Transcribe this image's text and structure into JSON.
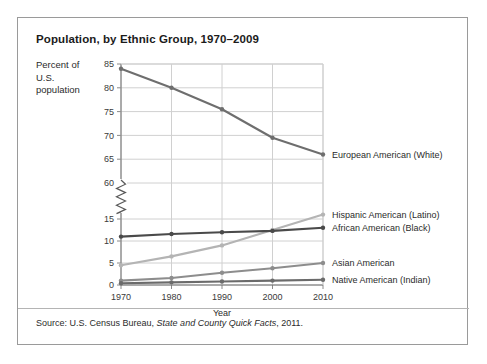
{
  "title": "Population, by Ethnic Group, 1970–2009",
  "axis_title": "Percent of U.S. population",
  "source": {
    "prefix": "Source:",
    "publisher": "U.S. Census Bureau,",
    "work": "State and County Quick Facts",
    "year": ", 2011."
  },
  "chart_data": {
    "type": "line",
    "title": "Population, by Ethnic Group, 1970–2009",
    "xlabel": "Year",
    "ylabel": "Percent of U.S. population",
    "x": [
      1970,
      1980,
      1990,
      2000,
      2010
    ],
    "xticklabels": [
      "1970",
      "1980",
      "1990",
      "2000",
      "2010"
    ],
    "xlim": [
      1970,
      2010
    ],
    "grid": true,
    "legend_position": "right-inline",
    "broken_axis": true,
    "axis_break_note": "y-axis broken between 15 and 60",
    "y_lower_ticks": [
      0,
      5,
      10,
      15
    ],
    "y_upper_ticks": [
      60,
      65,
      70,
      75,
      80,
      85
    ],
    "ylim_lower": [
      0,
      15
    ],
    "ylim_upper": [
      60,
      85
    ],
    "series": [
      {
        "name": "European American (White)",
        "color": "#6e6e6e",
        "values": [
          84,
          80,
          75.5,
          69.5,
          66
        ]
      },
      {
        "name": "Hispanic American (Latino)",
        "color": "#b4b4b4",
        "values": [
          4.5,
          6.5,
          9,
          12.5,
          16
        ]
      },
      {
        "name": "African American (Black)",
        "color": "#4a4a4a",
        "values": [
          11,
          11.6,
          12,
          12.3,
          13
        ]
      },
      {
        "name": "Asian American",
        "color": "#8d8d8d",
        "values": [
          1,
          1.6,
          2.8,
          3.8,
          5
        ]
      },
      {
        "name": "Native American (Indian)",
        "color": "#6b6b6b",
        "values": [
          0.4,
          0.6,
          0.8,
          1,
          1.2
        ]
      }
    ]
  }
}
